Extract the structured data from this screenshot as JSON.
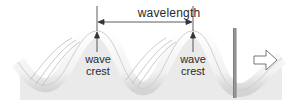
{
  "diagram": {
    "labels": {
      "wavelength": "wavelength",
      "crest_1": [
        "wave",
        "crest"
      ],
      "crest_2": [
        "wave",
        "crest"
      ]
    },
    "elements": {
      "wave_count_crests": 2,
      "barrier": "vertical bar",
      "direction_arrow": "right"
    },
    "colors": {
      "wave_fill": "#f4f4f4",
      "wave_shadow": "#c8c8c8",
      "line": "#333333",
      "barrier": "#8a8a8a",
      "text": "#2a2a2a"
    }
  }
}
